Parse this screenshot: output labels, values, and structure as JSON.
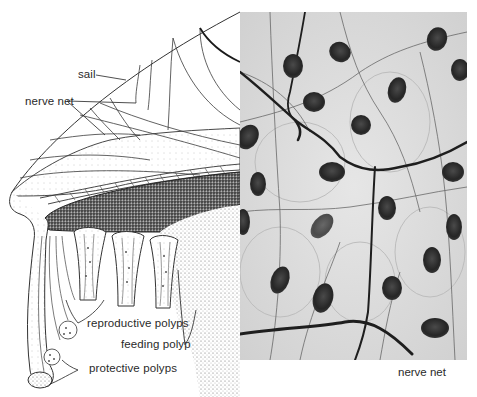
{
  "figure": {
    "drawing": {
      "labels": [
        {
          "id": "sail",
          "text": "sail"
        },
        {
          "id": "nerve-net",
          "text": "nerve net"
        },
        {
          "id": "reproductive-polyps",
          "text": "reproductive polyps"
        },
        {
          "id": "feeding-polyp",
          "text": "feeding polyp"
        },
        {
          "id": "protective-polyps",
          "text": "protective polyps"
        }
      ]
    },
    "photo": {
      "caption": "nerve net"
    },
    "colors": {
      "ink": "#2a2a2a",
      "paper": "#ffffff",
      "photo_bg": "#dcdcdc",
      "nucleus": "#2b2b2b",
      "fiber": "#1e1e1e"
    }
  }
}
